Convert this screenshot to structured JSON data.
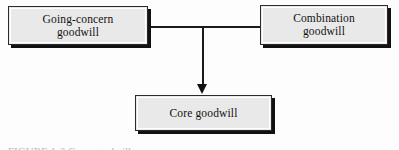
{
  "figure": {
    "type": "flow-diagram",
    "background_color": "#fdfdfd",
    "node_fill_color": "#e9e9e9",
    "node_border_color": "#2b2b2b",
    "shadow_color": "#111111",
    "connector_color": "#1a1a1a",
    "caption_partial": "FIGURE 1-2  Core goodwill"
  },
  "nodes": [
    {
      "id": "going-concern",
      "label": "Going-concern\ngoodwill",
      "line1": "Going-concern",
      "line2": "goodwill"
    },
    {
      "id": "combination",
      "label": "Combination\ngoodwill",
      "line1": "Combination",
      "line2": "goodwill"
    },
    {
      "id": "core",
      "label": "Core goodwill",
      "line1": "Core goodwill",
      "line2": ""
    }
  ],
  "connectors": [
    {
      "id": "going-concern-to-junction",
      "from": "going-concern",
      "to": "junction",
      "style": "plain-line",
      "orientation": "horizontal"
    },
    {
      "id": "combination-to-junction",
      "from": "combination",
      "to": "junction",
      "style": "plain-line",
      "orientation": "horizontal"
    },
    {
      "id": "junction-to-core",
      "from": "junction",
      "to": "core",
      "style": "arrow",
      "orientation": "vertical-down"
    }
  ]
}
